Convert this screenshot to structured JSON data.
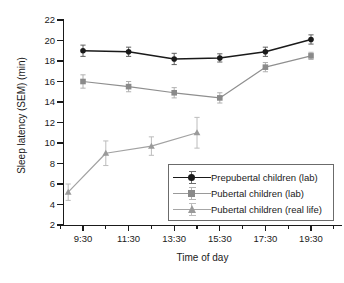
{
  "chart_data": {
    "type": "line",
    "title": "",
    "xlabel": "Time of day",
    "ylabel": "Sleep latency (SEM) (min)",
    "ylim": [
      2,
      22
    ],
    "yticks": [
      2,
      4,
      6,
      8,
      10,
      12,
      14,
      16,
      18,
      20,
      22
    ],
    "xtick_labels": [
      "9:30",
      "11:30",
      "13:30",
      "15:30",
      "17:30",
      "19:30"
    ],
    "x_major_values": [
      9.5,
      11.5,
      13.5,
      15.5,
      17.5,
      19.5
    ],
    "minor_ticks": true,
    "grid": false,
    "legend_position": "lower-right",
    "series": [
      {
        "name": "Prepubertal children (lab)",
        "marker": "circle",
        "color": "#1a1a1a",
        "x": [
          9.5,
          11.5,
          13.5,
          15.5,
          17.5,
          19.5
        ],
        "values": [
          19.0,
          18.9,
          18.2,
          18.3,
          18.9,
          20.1
        ],
        "errors": [
          0.55,
          0.45,
          0.55,
          0.4,
          0.45,
          0.45
        ]
      },
      {
        "name": "Pubertal children (lab)",
        "marker": "square",
        "color": "#8a8a8a",
        "x": [
          9.5,
          11.5,
          13.5,
          15.5,
          17.5,
          19.5
        ],
        "values": [
          16.0,
          15.5,
          14.9,
          14.4,
          17.4,
          18.5
        ],
        "errors": [
          0.65,
          0.5,
          0.5,
          0.5,
          0.45,
          0.35
        ]
      },
      {
        "name": "Pubertal children (real life)",
        "marker": "triangle",
        "color": "#9a9a9a",
        "x": [
          8.85,
          10.5,
          12.5,
          14.5
        ],
        "values": [
          5.2,
          9.0,
          9.7,
          11.0
        ],
        "errors": [
          0.8,
          1.2,
          0.9,
          1.5
        ]
      }
    ]
  },
  "legend": {
    "entries": [
      {
        "label": "Prepubertal children (lab)"
      },
      {
        "label": "Pubertal children (lab)"
      },
      {
        "label": "Pubertal children (real life)"
      }
    ]
  }
}
